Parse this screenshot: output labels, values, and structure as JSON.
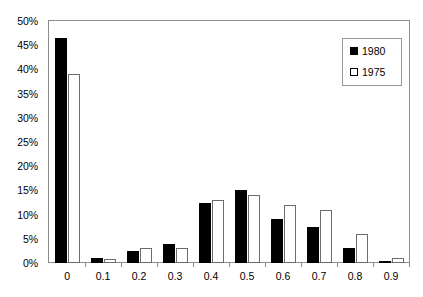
{
  "chart_data": {
    "type": "bar",
    "title": "",
    "subtitle": "",
    "xlabel": "",
    "ylabel": "",
    "categories": [
      "0",
      "0.1",
      "0.2",
      "0.3",
      "0.4",
      "0.5",
      "0.6",
      "0.7",
      "0.8",
      "0.9"
    ],
    "series": [
      {
        "name": "1980",
        "color": "#000000",
        "style": "filled",
        "values": [
          46.5,
          1.0,
          2.5,
          4.0,
          12.5,
          15.0,
          9.0,
          7.5,
          3.0,
          0.5
        ]
      },
      {
        "name": "1975",
        "color": "#ffffff",
        "style": "hollow",
        "values": [
          39.0,
          0.8,
          3.0,
          3.0,
          13.0,
          14.0,
          12.0,
          11.0,
          6.0,
          1.0
        ]
      }
    ],
    "ylim": [
      0,
      50
    ],
    "ytick_values": [
      0,
      5,
      10,
      15,
      20,
      25,
      30,
      35,
      40,
      45,
      50
    ],
    "ytick_labels": [
      "0%",
      "5%",
      "10%",
      "15%",
      "20%",
      "25%",
      "30%",
      "35%",
      "40%",
      "45%",
      "50%"
    ],
    "xtick_labels": [
      "0",
      "0.1",
      "0.2",
      "0.3",
      "0.4",
      "0.5",
      "0.6",
      "0.7",
      "0.8",
      "0.9"
    ],
    "grid": false,
    "legend": {
      "position": "top-right",
      "entries": [
        "1980",
        "1975"
      ]
    },
    "units": "percent",
    "frame_color": "#8d8d8d"
  }
}
